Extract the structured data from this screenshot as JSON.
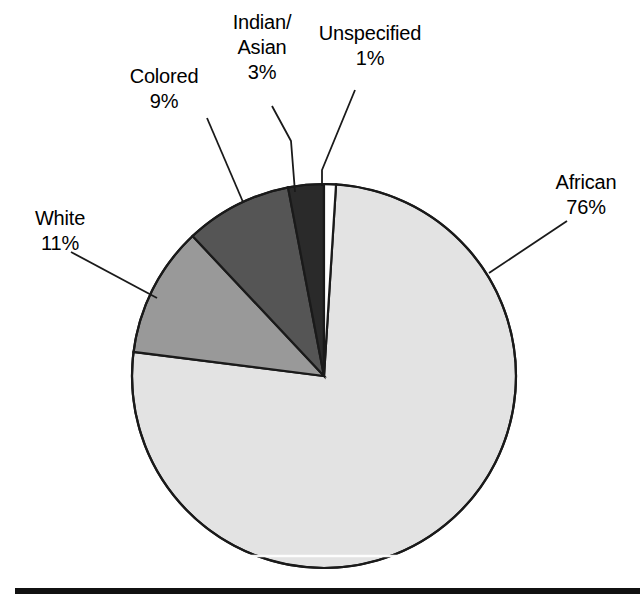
{
  "chart_data": {
    "type": "pie",
    "title": "",
    "subtitle": "",
    "xlabel": "",
    "ylabel": "",
    "legend_position": "none",
    "grid": false,
    "labels_outside": true,
    "categories": [
      "African",
      "White",
      "Colored",
      "Indian/Asian",
      "Unspecified"
    ],
    "values": [
      76,
      9,
      3,
      1,
      11
    ],
    "series": [
      {
        "name": "Population share",
        "values": [
          76,
          11,
          9,
          3,
          1
        ]
      }
    ],
    "slices": [
      {
        "name": "African",
        "value": 76,
        "value_text": "76%",
        "label_text": "African",
        "color": "#e3e3e3",
        "start_angle": 3.6,
        "end_angle": 277.2
      },
      {
        "name": "White",
        "value": 11,
        "value_text": "11%",
        "label_text": "White",
        "color": "#999999",
        "start_angle": 277.2,
        "end_angle": 316.8
      },
      {
        "name": "Colored",
        "value": 9,
        "value_text": "9%",
        "label_text": "Colored",
        "color": "#555555",
        "start_angle": 316.8,
        "end_angle": 349.2
      },
      {
        "name": "Indian/Asian",
        "value": 3,
        "value_text": "3%",
        "label_text": "Indian/ Asian",
        "color": "#2a2a2a",
        "start_angle": 349.2,
        "end_angle": 360.0
      },
      {
        "name": "Unspecified",
        "value": 1,
        "value_text": "1%",
        "label_text": "Unspecified",
        "color": "#ffffff",
        "start_angle": 0.0,
        "end_angle": 3.6
      }
    ],
    "units": "percent",
    "total": 100
  },
  "labels": {
    "colored": {
      "name": "Colored",
      "percent": "9%"
    },
    "indian_asian": {
      "name_line1": "Indian/",
      "name_line2": "Asian",
      "percent": "3%"
    },
    "unspecified": {
      "name": "Unspecified",
      "percent": "1%"
    },
    "white": {
      "name": "White",
      "percent": "11%"
    },
    "african": {
      "name": "African",
      "percent": "76%"
    }
  },
  "style": {
    "background": "#ffffff",
    "outline": "#1a1a1a",
    "text_color": "#000000",
    "baseline_color": "#111111",
    "african_fill": "#e3e3e3",
    "white_fill": "#999999",
    "colored_fill": "#555555",
    "indian_fill": "#2a2a2a",
    "unspecified_fill": "#ffffff"
  }
}
